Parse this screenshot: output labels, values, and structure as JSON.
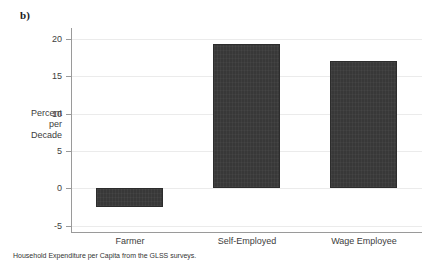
{
  "figure": {
    "panel_letter": "b)",
    "caption": "Household Expenditure per Capita from the GLSS surveys."
  },
  "axis": {
    "y_title_line1": "Percent",
    "y_title_line2": "per",
    "y_title_line3": "Decade",
    "ticks": [
      {
        "label": "20",
        "value": 20
      },
      {
        "label": "15",
        "value": 15
      },
      {
        "label": "10",
        "value": 10
      },
      {
        "label": "5",
        "value": 5
      },
      {
        "label": "0",
        "value": 0
      },
      {
        "label": "-5",
        "value": -5
      }
    ]
  },
  "chart_data": {
    "type": "bar",
    "title": "",
    "subtitle": "",
    "xlabel": "",
    "ylabel": "Percent per Decade",
    "categories": [
      "Farmer",
      "Self-Employed",
      "Wage Employee"
    ],
    "values": [
      -2.6,
      19.3,
      17.1
    ],
    "ylim": [
      -6.0,
      21.5
    ],
    "yticks": [
      -5,
      0,
      5,
      10,
      15,
      20
    ],
    "grid": true,
    "grid_axis": "y",
    "legend": null,
    "bar_color": "#383838",
    "gridline_color": "#ebebeb",
    "axis_color": "#9a9a9a",
    "annotation": "Household Expenditure per Capita from the GLSS surveys."
  }
}
